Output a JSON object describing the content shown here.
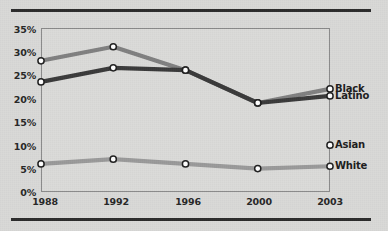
{
  "chart_data": {
    "type": "line",
    "title": "",
    "subtitle": "",
    "xlabel": "",
    "ylabel": "",
    "categories": [
      "1988",
      "1992",
      "1996",
      "2000",
      "2003"
    ],
    "x_tick_labels": [
      "1988",
      "1992",
      "1996",
      "2000",
      "2003"
    ],
    "y_tick_labels": [
      "0%",
      "5%",
      "10%",
      "15%",
      "20%",
      "25%",
      "30%",
      "35%"
    ],
    "y_tick_values": [
      0,
      5,
      10,
      15,
      20,
      25,
      30,
      35
    ],
    "ylim": [
      0,
      35
    ],
    "grid": false,
    "legend_position": "right-inline-labels",
    "series": [
      {
        "name": "Black",
        "color": "#808080",
        "values": [
          28,
          31,
          26,
          19,
          22
        ],
        "label": "Black",
        "label_value": 22
      },
      {
        "name": "Latino",
        "color": "#3a3a3a",
        "values": [
          23.5,
          26.5,
          26,
          19,
          20.5
        ],
        "label": "Latino",
        "label_value": 20.5
      },
      {
        "name": "Asian",
        "color": "#9a9a9a",
        "values": [
          null,
          null,
          null,
          null,
          10
        ],
        "label": "Asian",
        "label_value": 10
      },
      {
        "name": "White",
        "color": "#9a9a9a",
        "values": [
          6,
          7,
          6,
          5,
          5.5
        ],
        "label": "White",
        "label_value": 5.5
      }
    ]
  },
  "axes": {
    "y": {
      "t0": "0%",
      "t1": "5%",
      "t2": "10%",
      "t3": "15%",
      "t4": "20%",
      "t5": "25%",
      "t6": "30%",
      "t7": "35%"
    },
    "x": {
      "t0": "1988",
      "t1": "1992",
      "t2": "1996",
      "t3": "2000",
      "t4": "2003"
    }
  },
  "labels": {
    "black": "Black",
    "latino": "Latino",
    "asian": "Asian",
    "white": "White"
  },
  "colors": {
    "background": "#d9d9d7",
    "rule": "#2b2b2b",
    "frame": "#8a8a8a",
    "black_series": "#808080",
    "latino_series": "#3a3a3a",
    "white_series": "#9a9a9a",
    "marker_fill": "#ffffff",
    "marker_stroke": "#1f1f1f",
    "text": "#262626"
  }
}
